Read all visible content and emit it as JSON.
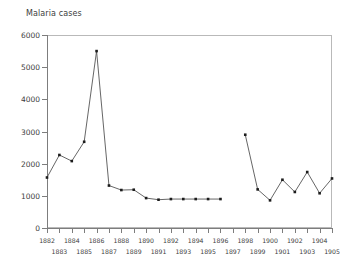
{
  "chart_data": {
    "type": "line",
    "title": "Malaria cases",
    "xlabel": "",
    "ylabel": "",
    "ylim": [
      0,
      6000
    ],
    "xlim": [
      1882,
      1905
    ],
    "grid": false,
    "legend": null,
    "yticks": [
      0,
      1000,
      2000,
      3000,
      4000,
      5000,
      6000
    ],
    "ytick_labels": [
      "0",
      "1000",
      "2000",
      "3000",
      "4000",
      "5000",
      "6000"
    ],
    "xticks": [
      1882,
      1883,
      1884,
      1885,
      1886,
      1887,
      1888,
      1889,
      1890,
      1891,
      1892,
      1893,
      1894,
      1895,
      1896,
      1897,
      1898,
      1899,
      1900,
      1901,
      1902,
      1903,
      1904,
      1905
    ],
    "xtick_labels": [
      "1882",
      "1883",
      "1884",
      "1885",
      "1886",
      "1887",
      "1888",
      "1889",
      "1890",
      "1891",
      "1892",
      "1893",
      "1894",
      "1895",
      "1896",
      "1897",
      "1898",
      "1899",
      "1900",
      "1901",
      "1902",
      "1903",
      "1904",
      "1905"
    ],
    "series": [
      {
        "name": "segment-1",
        "x": [
          1882,
          1883,
          1884,
          1885,
          1886,
          1887,
          1888,
          1889,
          1890,
          1891,
          1892,
          1893,
          1894,
          1895,
          1896
        ],
        "values": [
          1570,
          2270,
          2080,
          2680,
          5500,
          1320,
          1180,
          1190,
          930,
          880,
          900,
          900,
          900,
          900,
          900
        ]
      },
      {
        "name": "segment-2",
        "x": [
          1898,
          1899,
          1900,
          1901,
          1902,
          1903,
          1904,
          1905
        ],
        "values": [
          2900,
          1200,
          860,
          1500,
          1120,
          1740,
          1080,
          1540
        ]
      }
    ]
  }
}
